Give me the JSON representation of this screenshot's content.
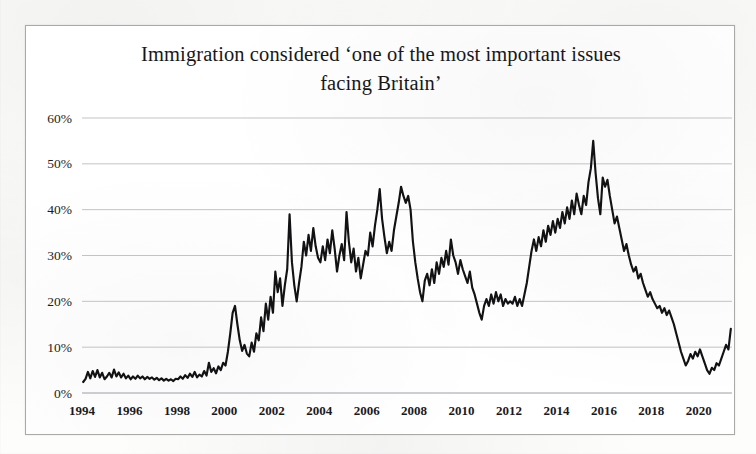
{
  "figure": {
    "title_line1": "Immigration considered  ‘one of the most important issues",
    "title_line2": "facing Britain’",
    "frame_color": "#a9a9a5",
    "series_color": "#121214",
    "gridline_color": "#b9bcc2"
  },
  "chart_data": {
    "type": "line",
    "title": "Immigration considered ‘one of the most important issues facing Britain’",
    "subtitle": "",
    "xlabel": "",
    "ylabel": "",
    "xlim": [
      1994.0,
      2021.4
    ],
    "ylim": [
      0,
      60
    ],
    "grid": true,
    "grid_axis": "y",
    "legend": false,
    "legend_position": "none",
    "y_tick_labels": [
      "0%",
      "10%",
      "20%",
      "30%",
      "40%",
      "50%",
      "60%"
    ],
    "y_ticks": [
      0,
      10,
      20,
      30,
      40,
      50,
      60
    ],
    "x_tick_labels": [
      "1994",
      "1996",
      "1998",
      "2000",
      "2002",
      "2004",
      "2006",
      "2008",
      "2010",
      "2012",
      "2014",
      "2016",
      "2018",
      "2020"
    ],
    "x_ticks": [
      1994,
      1996,
      1998,
      2000,
      2002,
      2004,
      2006,
      2008,
      2010,
      2012,
      2014,
      2016,
      2018,
      2020
    ],
    "y_unit": "percent",
    "x_unit": "year",
    "series": [
      {
        "name": "Immigration named one of the most important issues facing Britain",
        "color": "#121214",
        "x": [
          1994.05,
          1994.15,
          1994.25,
          1994.35,
          1994.45,
          1994.55,
          1994.65,
          1994.75,
          1994.85,
          1994.95,
          1995.05,
          1995.15,
          1995.25,
          1995.35,
          1995.45,
          1995.55,
          1995.65,
          1995.75,
          1995.85,
          1995.95,
          1996.05,
          1996.15,
          1996.25,
          1996.35,
          1996.45,
          1996.55,
          1996.65,
          1996.75,
          1996.85,
          1996.95,
          1997.05,
          1997.15,
          1997.25,
          1997.35,
          1997.45,
          1997.55,
          1997.65,
          1997.75,
          1997.85,
          1997.95,
          1998.05,
          1998.15,
          1998.25,
          1998.35,
          1998.45,
          1998.55,
          1998.65,
          1998.75,
          1998.85,
          1998.95,
          1999.05,
          1999.15,
          1999.25,
          1999.35,
          1999.45,
          1999.55,
          1999.65,
          1999.75,
          1999.85,
          1999.95,
          2000.05,
          2000.15,
          2000.25,
          2000.35,
          2000.45,
          2000.55,
          2000.65,
          2000.75,
          2000.85,
          2000.95,
          2001.05,
          2001.15,
          2001.25,
          2001.35,
          2001.45,
          2001.55,
          2001.65,
          2001.75,
          2001.85,
          2001.95,
          2002.05,
          2002.15,
          2002.25,
          2002.35,
          2002.45,
          2002.55,
          2002.65,
          2002.75,
          2002.85,
          2002.95,
          2003.05,
          2003.15,
          2003.25,
          2003.35,
          2003.45,
          2003.55,
          2003.65,
          2003.75,
          2003.85,
          2003.95,
          2004.05,
          2004.15,
          2004.25,
          2004.35,
          2004.45,
          2004.55,
          2004.65,
          2004.75,
          2004.85,
          2004.95,
          2005.05,
          2005.15,
          2005.25,
          2005.35,
          2005.45,
          2005.55,
          2005.65,
          2005.75,
          2005.85,
          2005.95,
          2006.05,
          2006.15,
          2006.25,
          2006.35,
          2006.45,
          2006.55,
          2006.65,
          2006.75,
          2006.85,
          2006.95,
          2007.05,
          2007.15,
          2007.25,
          2007.35,
          2007.45,
          2007.55,
          2007.65,
          2007.75,
          2007.85,
          2007.95,
          2008.05,
          2008.15,
          2008.25,
          2008.35,
          2008.45,
          2008.55,
          2008.65,
          2008.75,
          2008.85,
          2008.95,
          2009.05,
          2009.15,
          2009.25,
          2009.35,
          2009.45,
          2009.55,
          2009.65,
          2009.75,
          2009.85,
          2009.95,
          2010.05,
          2010.15,
          2010.25,
          2010.35,
          2010.45,
          2010.55,
          2010.65,
          2010.75,
          2010.85,
          2010.95,
          2011.05,
          2011.15,
          2011.25,
          2011.35,
          2011.45,
          2011.55,
          2011.65,
          2011.75,
          2011.85,
          2011.95,
          2012.05,
          2012.15,
          2012.25,
          2012.35,
          2012.45,
          2012.55,
          2012.65,
          2012.75,
          2012.85,
          2012.95,
          2013.05,
          2013.15,
          2013.25,
          2013.35,
          2013.45,
          2013.55,
          2013.65,
          2013.75,
          2013.85,
          2013.95,
          2014.05,
          2014.15,
          2014.25,
          2014.35,
          2014.45,
          2014.55,
          2014.65,
          2014.75,
          2014.85,
          2014.95,
          2015.05,
          2015.15,
          2015.25,
          2015.35,
          2015.45,
          2015.55,
          2015.65,
          2015.75,
          2015.85,
          2015.95,
          2016.05,
          2016.15,
          2016.25,
          2016.35,
          2016.45,
          2016.55,
          2016.65,
          2016.75,
          2016.85,
          2016.95,
          2017.05,
          2017.15,
          2017.25,
          2017.35,
          2017.45,
          2017.55,
          2017.65,
          2017.75,
          2017.85,
          2017.95,
          2018.05,
          2018.15,
          2018.25,
          2018.35,
          2018.45,
          2018.55,
          2018.65,
          2018.75,
          2018.85,
          2018.95,
          2019.05,
          2019.15,
          2019.25,
          2019.35,
          2019.45,
          2019.55,
          2019.65,
          2019.75,
          2019.85,
          2019.95,
          2020.05,
          2020.15,
          2020.25,
          2020.35,
          2020.45,
          2020.55,
          2020.65,
          2020.75,
          2020.85,
          2020.95,
          2021.05,
          2021.15,
          2021.25,
          2021.35
        ],
        "values": [
          2.4,
          3.1,
          4.6,
          3.2,
          4.8,
          3.5,
          5.0,
          3.4,
          4.4,
          3.0,
          3.6,
          4.4,
          3.4,
          5.1,
          3.6,
          4.5,
          3.4,
          4.2,
          3.2,
          3.8,
          3.0,
          3.6,
          3.1,
          3.8,
          3.2,
          3.6,
          3.0,
          3.5,
          3.1,
          3.4,
          2.9,
          3.3,
          2.8,
          3.2,
          2.7,
          3.1,
          2.7,
          3.0,
          2.6,
          3.1,
          3.0,
          3.6,
          3.1,
          3.9,
          3.3,
          4.2,
          3.5,
          4.6,
          3.4,
          4.0,
          3.6,
          4.8,
          3.8,
          6.6,
          4.6,
          5.4,
          4.3,
          5.8,
          5.0,
          6.6,
          6.0,
          9.0,
          13.0,
          17.5,
          19.0,
          15.0,
          11.5,
          9.2,
          10.5,
          8.6,
          8.0,
          11.0,
          9.0,
          13.0,
          11.5,
          16.5,
          13.5,
          19.5,
          16.0,
          21.0,
          17.5,
          26.5,
          22.0,
          25.0,
          19.0,
          23.5,
          27.0,
          39.0,
          28.5,
          23.5,
          20.0,
          24.0,
          27.5,
          33.0,
          30.0,
          34.5,
          31.0,
          36.0,
          32.0,
          29.5,
          28.5,
          32.0,
          29.0,
          33.5,
          30.5,
          35.5,
          31.5,
          26.5,
          30.0,
          32.5,
          29.0,
          39.5,
          33.0,
          28.5,
          31.5,
          26.5,
          29.5,
          25.0,
          28.0,
          31.0,
          30.0,
          35.0,
          32.0,
          36.5,
          40.0,
          44.5,
          38.0,
          34.0,
          30.5,
          33.0,
          31.0,
          35.5,
          38.5,
          41.5,
          45.0,
          43.0,
          41.5,
          43.0,
          40.0,
          33.0,
          28.5,
          25.0,
          22.0,
          20.0,
          24.5,
          26.0,
          23.5,
          27.0,
          24.0,
          28.5,
          26.0,
          29.5,
          27.5,
          31.0,
          28.0,
          33.5,
          30.0,
          28.5,
          26.0,
          29.0,
          27.0,
          25.5,
          24.0,
          26.5,
          23.0,
          21.5,
          19.5,
          17.5,
          16.0,
          19.0,
          20.5,
          19.0,
          21.5,
          19.5,
          22.0,
          20.0,
          21.5,
          19.0,
          20.5,
          19.5,
          20.0,
          19.5,
          21.0,
          19.0,
          20.5,
          19.0,
          21.5,
          24.0,
          27.5,
          31.0,
          33.5,
          31.0,
          34.0,
          32.0,
          35.5,
          33.0,
          36.5,
          34.5,
          37.5,
          35.0,
          38.0,
          36.0,
          39.5,
          37.0,
          40.5,
          38.0,
          42.0,
          39.0,
          43.5,
          41.0,
          39.0,
          43.0,
          41.0,
          46.0,
          49.0,
          55.0,
          48.0,
          42.5,
          39.0,
          47.0,
          45.0,
          46.5,
          43.0,
          40.0,
          37.0,
          38.5,
          36.0,
          33.5,
          31.0,
          32.5,
          30.0,
          28.0,
          26.5,
          27.5,
          25.0,
          26.0,
          24.0,
          22.5,
          21.0,
          22.0,
          20.5,
          19.5,
          18.5,
          19.0,
          17.5,
          18.5,
          17.0,
          18.0,
          16.5,
          15.0,
          13.0,
          11.0,
          9.0,
          7.5,
          6.0,
          7.0,
          8.5,
          7.5,
          9.0,
          8.0,
          9.5,
          8.0,
          6.5,
          5.0,
          4.2,
          5.5,
          5.0,
          6.5,
          6.0,
          7.5,
          9.0,
          10.5,
          9.5,
          14.0
        ]
      }
    ],
    "annotations": {
      "notable_peaks": [
        {
          "approx_year": 2002.75,
          "value": 39
        },
        {
          "approx_year": 2006.55,
          "value": 44.5
        },
        {
          "approx_year": 2007.45,
          "value": 45
        },
        {
          "approx_year": 2015.55,
          "value": 55
        }
      ],
      "notable_troughs": [
        {
          "approx_year": 1997.85,
          "value": 2.6
        },
        {
          "approx_year": 2011.85,
          "value": 16
        },
        {
          "approx_year": 2020.45,
          "value": 4.2
        }
      ],
      "final_value": 14
    }
  }
}
